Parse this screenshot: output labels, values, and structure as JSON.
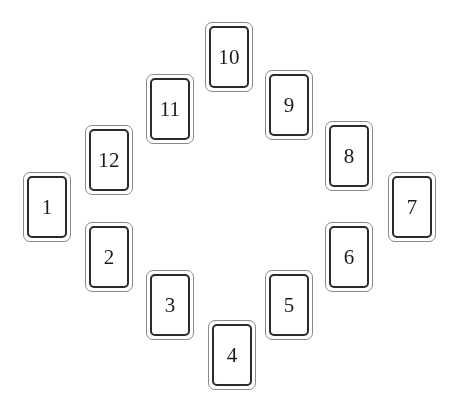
{
  "canvas": {
    "width": 453,
    "height": 408,
    "background": "#ffffff"
  },
  "style": {
    "card_background": "#ffffff",
    "outer_border_color": "#8a8a8a",
    "inner_border_color": "#2a2a2a",
    "label_color": "#1b1b1b"
  },
  "layout": {
    "name": "clock-spread",
    "description": "Twelve numbered rectangular cards arranged in a ring like a clock face",
    "card_count": 12,
    "card_width": 48,
    "card_height": 70
  },
  "cards": [
    {
      "label": "1",
      "x": 23,
      "y": 172,
      "w": 48,
      "h": 70,
      "rotation": 0.0
    },
    {
      "label": "2",
      "x": 85,
      "y": 222,
      "w": 48,
      "h": 70,
      "rotation": 0.0
    },
    {
      "label": "3",
      "x": 146,
      "y": 270,
      "w": 48,
      "h": 70,
      "rotation": 0.0
    },
    {
      "label": "4",
      "x": 208,
      "y": 320,
      "w": 48,
      "h": 70,
      "rotation": 0.0
    },
    {
      "label": "5",
      "x": 265,
      "y": 270,
      "w": 48,
      "h": 70,
      "rotation": 0.0
    },
    {
      "label": "6",
      "x": 325,
      "y": 222,
      "w": 48,
      "h": 70,
      "rotation": 0.0
    },
    {
      "label": "7",
      "x": 388,
      "y": 172,
      "w": 48,
      "h": 70,
      "rotation": 0.0
    },
    {
      "label": "8",
      "x": 325,
      "y": 121,
      "w": 48,
      "h": 70,
      "rotation": 0.0
    },
    {
      "label": "9",
      "x": 265,
      "y": 70,
      "w": 48,
      "h": 70,
      "rotation": 0.0
    },
    {
      "label": "10",
      "x": 205,
      "y": 22,
      "w": 48,
      "h": 70,
      "rotation": 0.0
    },
    {
      "label": "11",
      "x": 146,
      "y": 74,
      "w": 48,
      "h": 70,
      "rotation": 0.0
    },
    {
      "label": "12",
      "x": 85,
      "y": 125,
      "w": 48,
      "h": 70,
      "rotation": 0.0
    }
  ]
}
